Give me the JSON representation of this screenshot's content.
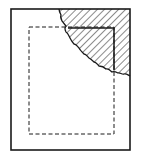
{
  "figure": {
    "type": "patent-line-drawing",
    "colors": {
      "stroke": "#1a1a1a",
      "background": "#ffffff"
    },
    "outer_rect": {
      "x": 11,
      "y": 9,
      "w": 119,
      "h": 141
    },
    "dashed_rect": {
      "x": 29,
      "y": 27,
      "w": 85,
      "h": 107
    },
    "hatched_region": {
      "label": "torn-corner",
      "hatch": "diagonal"
    }
  }
}
